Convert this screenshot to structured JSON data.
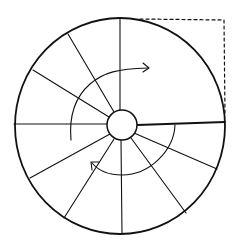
{
  "diagram": {
    "title": "Hand-drawn circle divided into radial segments with rotation arrows",
    "colors": {
      "ink": "#111111",
      "background": "#ffffff"
    },
    "outer_circle": {
      "cx": 120,
      "cy": 126,
      "rx": 105,
      "ry": 108
    },
    "hub_circle": {
      "cx": 122,
      "cy": 125,
      "r": 15
    },
    "dashed_corner": {
      "points": "140,19 224,20 225,115",
      "meaning": "square corner showing the circle's top-right quadrant bounding box"
    },
    "spokes": [
      {
        "name": "top",
        "from": [
          120,
          110
        ],
        "to": [
          120,
          18
        ]
      },
      {
        "name": "upper-left-1",
        "from": [
          114,
          112
        ],
        "to": [
          68,
          34
        ]
      },
      {
        "name": "upper-left-2",
        "from": [
          109,
          117
        ],
        "to": [
          33,
          70
        ]
      },
      {
        "name": "left",
        "from": [
          107,
          124
        ],
        "to": [
          14,
          124
        ]
      },
      {
        "name": "lower-left-1",
        "from": [
          110,
          134
        ],
        "to": [
          30,
          178
        ]
      },
      {
        "name": "lower-left-2",
        "from": [
          114,
          139
        ],
        "to": [
          64,
          218
        ]
      },
      {
        "name": "bottom",
        "from": [
          121,
          140
        ],
        "to": [
          122,
          234
        ]
      },
      {
        "name": "lower-right-1",
        "from": [
          131,
          138
        ],
        "to": [
          186,
          213
        ]
      },
      {
        "name": "lower-right-2",
        "from": [
          134,
          133
        ],
        "to": [
          217,
          169
        ]
      },
      {
        "name": "right",
        "from": [
          137,
          125
        ],
        "to": [
          225,
          122
        ],
        "thick": true
      }
    ],
    "arrows": [
      {
        "name": "upper-rotation-arrow",
        "direction": "clockwise",
        "path": "M71,140 C69,118 74,98 90,84 C104,72 118,69 148,68"
      },
      {
        "name": "lower-rotation-arrow",
        "direction": "clockwise",
        "path": "M175,125 C174,150 150,175 122,175 C108,175 98,170 92,163"
      }
    ]
  }
}
